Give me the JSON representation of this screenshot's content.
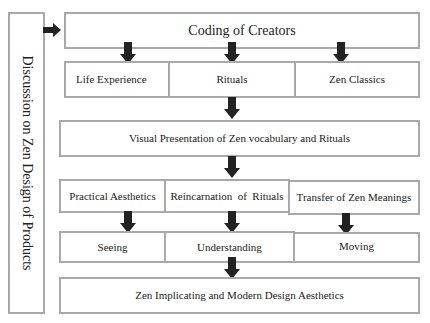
{
  "diagram": {
    "side_label": "Discussion on Zen Design of Products",
    "top": "Coding of Creators",
    "row_sources": [
      "Life Experience",
      "Rituals",
      "Zen Classics"
    ],
    "visual": "Visual Presentation of Zen vocabulary and Rituals",
    "row_modes": [
      "Practical Aesthetics",
      "Reincarnation  of  Rituals",
      "Transfer of Zen Meanings"
    ],
    "row_actions": [
      "Seeing",
      "Understanding",
      "Moving"
    ],
    "bottom": "Zen Implicating and Modern Design Aesthetics"
  },
  "colors": {
    "border": "#a9a9a9",
    "arrow": "#222222",
    "text": "#222222"
  }
}
